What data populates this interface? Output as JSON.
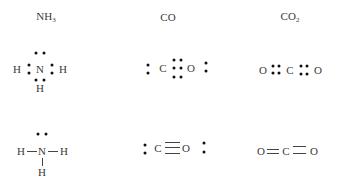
{
  "titles": {
    "nh3": {
      "base": "NH",
      "sub": "3"
    },
    "co": {
      "base": "CO"
    },
    "co2": {
      "base": "CO",
      "sub": "2"
    }
  },
  "atoms": {
    "N": "N",
    "H": "H",
    "C": "C",
    "O": "O"
  },
  "diagram": {
    "rows": [
      "electron-dot structures",
      "line-bond structures"
    ],
    "molecules": [
      "NH3",
      "CO",
      "CO2"
    ]
  }
}
